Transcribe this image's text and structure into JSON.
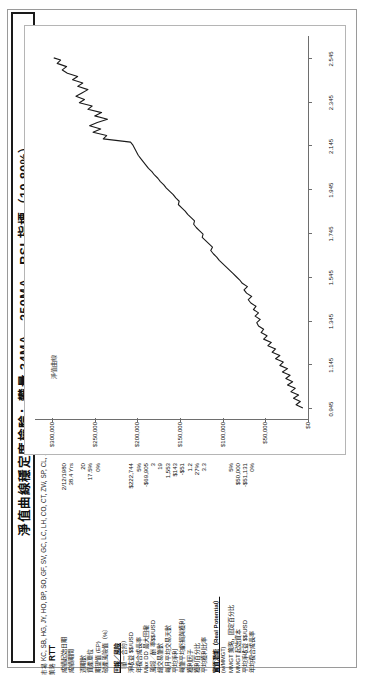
{
  "document": {
    "title": "淨值曲線穩定度檢驗：攀量 34MA、250MA、RSI 指標（10,80%）",
    "market_label": "市場",
    "strategy_label": "策略",
    "market_value": "KC, SB, HG, JY, HO, BP, SO, GF, SV, GC, LC, LH, CO, CT, ZW, SP, CL, ZB, TY, FV, NG, ND, EC, YM",
    "strategy_value": "RTT"
  },
  "stats": {
    "rows": [
      {
        "key": "成績起始日期",
        "value": "2/12/1980",
        "style": "plain"
      },
      {
        "key": "成績期間",
        "value": "38.4 Yrs",
        "style": "plain"
      },
      {
        "key": "",
        "value": "",
        "style": "gap"
      },
      {
        "key": "週期數",
        "value": "20",
        "style": "plain"
      },
      {
        "key": "資產單位",
        "value": "17.5%",
        "style": "plain"
      },
      {
        "key": "期望值 (EP)",
        "value": "0%",
        "style": "plain"
      },
      {
        "key": "破產風險值（%）",
        "value": "",
        "style": "plain"
      },
      {
        "key": "",
        "value": "",
        "style": "gap"
      },
      {
        "key": "回報／風險",
        "value": "",
        "style": "head"
      },
      {
        "key": "（單一合約）",
        "value": "",
        "style": "sub"
      },
      {
        "key": "淨收益 $$/USD",
        "value": "$222,744",
        "style": "plain"
      },
      {
        "key": "年複合成長率",
        "value": "5%",
        "style": "plain"
      },
      {
        "key": "Max DD 最大回撤",
        "value": "-$69,905",
        "style": "plain"
      },
      {
        "key": "風報／酬 率$$/USD",
        "value": "3",
        "style": "plain"
      },
      {
        "key": "總交易筆數",
        "value": "19",
        "style": "plain"
      },
      {
        "key": "每月平均交易天數",
        "value": "1,553",
        "style": "plain"
      },
      {
        "key": "平均淨利",
        "value": "$143",
        "style": "plain"
      },
      {
        "key": "每筆平均虧損與獲利",
        "value": "-$51",
        "style": "plain"
      },
      {
        "key": "獲利因子",
        "value": "1.2",
        "style": "plain"
      },
      {
        "key": "獲利百分比",
        "value": "27%",
        "style": "plain"
      },
      {
        "key": "平均獲利比率",
        "value": "3.3",
        "style": "plain"
      },
      {
        "key": "",
        "value": "",
        "style": "gap"
      },
      {
        "key": "實質潛能（Real Potential）",
        "value": "",
        "style": "head"
      },
      {
        "key": "(w/MMGT)",
        "value": "",
        "style": "sub"
      },
      {
        "key": "MMGT 策略，固定百分比",
        "value": "5%",
        "style": "plain"
      },
      {
        "key": "MMGT 起始資本",
        "value": "$50,000",
        "style": "plain"
      },
      {
        "key": "平均淨收益 $$/USD",
        "value": "-$51,131",
        "style": "plain"
      },
      {
        "key": "年均複合成長率",
        "value": "0%",
        "style": "plain"
      }
    ]
  },
  "chart_data": {
    "type": "line",
    "title": "",
    "series_name": "淨值曲線",
    "xlabel": "",
    "ylabel": "",
    "ylim": [
      0,
      320000
    ],
    "yticks": [
      "$0",
      "$50,000",
      "$100,000",
      "$150,000",
      "$200,000",
      "$250,000",
      "$300,000"
    ],
    "ytick_values": [
      0,
      50000,
      100000,
      150000,
      200000,
      250000,
      300000
    ],
    "xticks": [
      "0.945",
      "1.145",
      "1.345",
      "1.545",
      "1.745",
      "1.945",
      "2.145",
      "2.345",
      "2.545"
    ],
    "xtick_values": [
      0.945,
      1.145,
      1.345,
      1.545,
      1.745,
      1.945,
      2.145,
      2.345,
      2.545
    ],
    "xlim": [
      0.895,
      2.645
    ],
    "grid": false,
    "legend": "inside-top-left",
    "x": [
      0.945,
      0.96,
      0.975,
      0.99,
      1.005,
      1.02,
      1.035,
      1.05,
      1.065,
      1.08,
      1.095,
      1.11,
      1.125,
      1.14,
      1.155,
      1.17,
      1.185,
      1.2,
      1.215,
      1.23,
      1.245,
      1.26,
      1.275,
      1.29,
      1.305,
      1.32,
      1.335,
      1.35,
      1.365,
      1.38,
      1.395,
      1.41,
      1.425,
      1.44,
      1.455,
      1.47,
      1.485,
      1.5,
      1.515,
      1.53,
      1.545,
      1.56,
      1.575,
      1.59,
      1.605,
      1.62,
      1.635,
      1.65,
      1.665,
      1.68,
      1.695,
      1.71,
      1.725,
      1.74,
      1.755,
      1.77,
      1.785,
      1.8,
      1.815,
      1.83,
      1.845,
      1.86,
      1.875,
      1.89,
      1.905,
      1.92,
      1.935,
      1.95,
      1.965,
      1.98,
      1.995,
      2.01,
      2.025,
      2.04,
      2.055,
      2.07,
      2.085,
      2.1,
      2.115,
      2.13,
      2.145,
      2.16,
      2.175,
      2.19,
      2.205,
      2.22,
      2.235,
      2.25,
      2.265,
      2.28,
      2.295,
      2.31,
      2.325,
      2.34,
      2.355,
      2.37,
      2.385,
      2.4,
      2.415,
      2.43,
      2.445,
      2.46,
      2.475,
      2.49,
      2.505,
      2.52,
      2.535,
      2.545
    ],
    "y": [
      6000,
      14000,
      9000,
      17000,
      11000,
      20000,
      15000,
      24000,
      18000,
      26000,
      21000,
      30000,
      24000,
      33000,
      29000,
      38000,
      33000,
      42000,
      38000,
      47000,
      43000,
      52000,
      48000,
      55000,
      52000,
      58000,
      60000,
      56000,
      62000,
      58000,
      64000,
      61000,
      67000,
      70000,
      66000,
      72000,
      75000,
      71000,
      77000,
      80000,
      84000,
      88000,
      92000,
      96000,
      100000,
      104000,
      107000,
      111000,
      114000,
      112000,
      116000,
      120000,
      124000,
      123000,
      127000,
      131000,
      134000,
      133000,
      137000,
      141000,
      144000,
      148000,
      152000,
      151000,
      155000,
      158000,
      162000,
      166000,
      169000,
      173000,
      176000,
      180000,
      183000,
      187000,
      190000,
      193000,
      196000,
      199000,
      201000,
      203000,
      205000,
      208000,
      240000,
      236000,
      252000,
      243000,
      256000,
      247000,
      235000,
      250000,
      242000,
      258000,
      253000,
      268000,
      262000,
      272000,
      265000,
      258000,
      270000,
      264000,
      276000,
      270000,
      282000,
      288000,
      283000,
      294000,
      290000,
      298000
    ]
  }
}
